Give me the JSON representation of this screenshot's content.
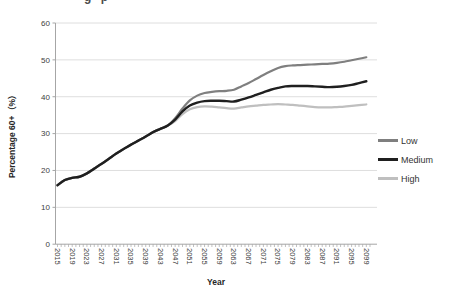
{
  "clipped_text_fragment": "g p",
  "chart_data": {
    "type": "line",
    "title": "",
    "xlabel": "Year",
    "ylabel": "Percentage 60+（%）",
    "ylim": [
      0,
      60
    ],
    "ytick_step": 10,
    "x_range": [
      2015,
      2100
    ],
    "grid": true,
    "legend_position": "right",
    "xtick_labels": [
      2015,
      2019,
      2023,
      2027,
      2031,
      2035,
      2039,
      2043,
      2047,
      2051,
      2055,
      2059,
      2063,
      2067,
      2071,
      2075,
      2079,
      2083,
      2087,
      2091,
      2095,
      2099
    ],
    "x": [
      2015,
      2017,
      2019,
      2021,
      2023,
      2025,
      2027,
      2029,
      2031,
      2033,
      2035,
      2037,
      2039,
      2041,
      2043,
      2045,
      2047,
      2049,
      2051,
      2053,
      2055,
      2057,
      2059,
      2061,
      2063,
      2065,
      2067,
      2069,
      2071,
      2073,
      2075,
      2077,
      2079,
      2081,
      2083,
      2085,
      2087,
      2089,
      2091,
      2093,
      2095,
      2097,
      2099
    ],
    "series": [
      {
        "name": "Low",
        "color": "#7f7f7f",
        "width": 2.2,
        "values": [
          16,
          17.4,
          18,
          18.3,
          19.2,
          20.5,
          21.8,
          23.2,
          24.6,
          25.8,
          27,
          28.1,
          29.2,
          30.4,
          31.3,
          32.2,
          34.2,
          36.8,
          39,
          40.3,
          41,
          41.3,
          41.5,
          41.6,
          41.9,
          42.8,
          43.7,
          44.8,
          45.9,
          46.9,
          47.8,
          48.3,
          48.5,
          48.6,
          48.7,
          48.8,
          48.9,
          49,
          49.2,
          49.5,
          49.9,
          50.3,
          50.7
        ]
      },
      {
        "name": "Medium",
        "color": "#1f1f1f",
        "width": 2.4,
        "values": [
          16,
          17.4,
          18,
          18.3,
          19.2,
          20.5,
          21.8,
          23.2,
          24.6,
          25.8,
          27,
          28.1,
          29.2,
          30.4,
          31.3,
          32.2,
          33.8,
          36,
          37.6,
          38.4,
          38.8,
          38.9,
          38.9,
          38.8,
          38.7,
          39.2,
          39.8,
          40.5,
          41.2,
          41.9,
          42.4,
          42.8,
          42.9,
          42.9,
          42.9,
          42.8,
          42.7,
          42.6,
          42.7,
          42.9,
          43.2,
          43.7,
          44.2
        ]
      },
      {
        "name": "High",
        "color": "#bfbfbf",
        "width": 2.2,
        "values": [
          16,
          17.4,
          18,
          18.3,
          19.2,
          20.5,
          21.8,
          23.2,
          24.6,
          25.8,
          27,
          28.1,
          29.2,
          30.4,
          31.3,
          32.2,
          33.4,
          35.3,
          36.6,
          37.2,
          37.4,
          37.3,
          37.1,
          36.9,
          36.8,
          37.1,
          37.4,
          37.6,
          37.8,
          37.9,
          38,
          37.9,
          37.8,
          37.6,
          37.4,
          37.2,
          37.1,
          37.1,
          37.2,
          37.3,
          37.5,
          37.7,
          37.9
        ]
      }
    ],
    "draw_order": [
      2,
      0,
      1
    ],
    "colors": {
      "gridline": "#dedede",
      "axis": "#a6a6a6",
      "tick_label": "#404040"
    }
  }
}
